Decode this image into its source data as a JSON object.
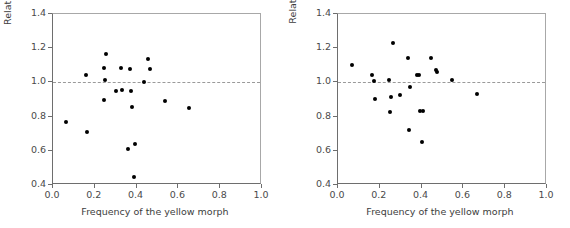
{
  "chart_data": [
    {
      "type": "scatter",
      "panel": "left",
      "title": "",
      "xlabel": "Frequency of the yellow morph",
      "ylabel": "Relative female reproductive success",
      "xlim": [
        0.0,
        1.0
      ],
      "ylim": [
        0.4,
        1.4
      ],
      "xticks": [
        "0.0",
        "0.2",
        "0.4",
        "0.6",
        "0.8",
        "1.0"
      ],
      "xtickvals": [
        0.0,
        0.2,
        0.4,
        0.6,
        0.8,
        1.0
      ],
      "yticks": [
        "0.4",
        "0.6",
        "0.8",
        "1.0",
        "1.2",
        "1.4"
      ],
      "ytickvals": [
        0.4,
        0.6,
        0.8,
        1.0,
        1.2,
        1.4
      ],
      "grid": false,
      "legend": "none",
      "reference_line": {
        "y": 1.0,
        "style": "dashed",
        "color": "#9a9a9a"
      },
      "marker": {
        "shape": "circle",
        "color": "#000000",
        "size": 4
      },
      "points": [
        {
          "x": 0.062,
          "y": 0.768
        },
        {
          "x": 0.157,
          "y": 1.043
        },
        {
          "x": 0.165,
          "y": 0.712
        },
        {
          "x": 0.243,
          "y": 0.9
        },
        {
          "x": 0.245,
          "y": 1.085
        },
        {
          "x": 0.249,
          "y": 1.015
        },
        {
          "x": 0.252,
          "y": 1.168
        },
        {
          "x": 0.3,
          "y": 0.947
        },
        {
          "x": 0.325,
          "y": 1.085
        },
        {
          "x": 0.328,
          "y": 0.955
        },
        {
          "x": 0.36,
          "y": 0.613
        },
        {
          "x": 0.37,
          "y": 1.077
        },
        {
          "x": 0.374,
          "y": 0.947
        },
        {
          "x": 0.378,
          "y": 0.858
        },
        {
          "x": 0.388,
          "y": 0.447
        },
        {
          "x": 0.392,
          "y": 0.638
        },
        {
          "x": 0.435,
          "y": 1.005
        },
        {
          "x": 0.455,
          "y": 1.137
        },
        {
          "x": 0.462,
          "y": 1.078
        },
        {
          "x": 0.537,
          "y": 0.89
        },
        {
          "x": 0.65,
          "y": 0.853
        }
      ]
    },
    {
      "type": "scatter",
      "panel": "right",
      "title": "",
      "xlabel": "Frequency of the yellow morph",
      "ylabel": "Relative male reproductive success",
      "xlim": [
        0.0,
        1.0
      ],
      "ylim": [
        0.4,
        1.4
      ],
      "xticks": [
        "0.0",
        "0.2",
        "0.4",
        "0.6",
        "0.8",
        "1.0"
      ],
      "xtickvals": [
        0.0,
        0.2,
        0.4,
        0.6,
        0.8,
        1.0
      ],
      "yticks": [
        "0.4",
        "0.6",
        "0.8",
        "1.0",
        "1.2",
        "1.4"
      ],
      "ytickvals": [
        0.4,
        0.6,
        0.8,
        1.0,
        1.2,
        1.4
      ],
      "grid": false,
      "legend": "none",
      "reference_line": {
        "y": 1.0,
        "style": "dashed",
        "color": "#9a9a9a"
      },
      "marker": {
        "shape": "circle",
        "color": "#000000",
        "size": 4
      },
      "points": [
        {
          "x": 0.068,
          "y": 1.102
        },
        {
          "x": 0.165,
          "y": 1.043
        },
        {
          "x": 0.172,
          "y": 1.008
        },
        {
          "x": 0.175,
          "y": 0.903
        },
        {
          "x": 0.243,
          "y": 1.014
        },
        {
          "x": 0.25,
          "y": 0.825
        },
        {
          "x": 0.252,
          "y": 0.913
        },
        {
          "x": 0.262,
          "y": 1.233
        },
        {
          "x": 0.296,
          "y": 0.925
        },
        {
          "x": 0.337,
          "y": 1.141
        },
        {
          "x": 0.341,
          "y": 0.723
        },
        {
          "x": 0.344,
          "y": 0.973
        },
        {
          "x": 0.379,
          "y": 1.043
        },
        {
          "x": 0.389,
          "y": 1.043
        },
        {
          "x": 0.392,
          "y": 0.831
        },
        {
          "x": 0.4,
          "y": 0.653
        },
        {
          "x": 0.409,
          "y": 0.831
        },
        {
          "x": 0.447,
          "y": 1.143
        },
        {
          "x": 0.47,
          "y": 1.072
        },
        {
          "x": 0.476,
          "y": 1.058
        },
        {
          "x": 0.547,
          "y": 1.012
        },
        {
          "x": 0.665,
          "y": 0.934
        }
      ]
    }
  ]
}
